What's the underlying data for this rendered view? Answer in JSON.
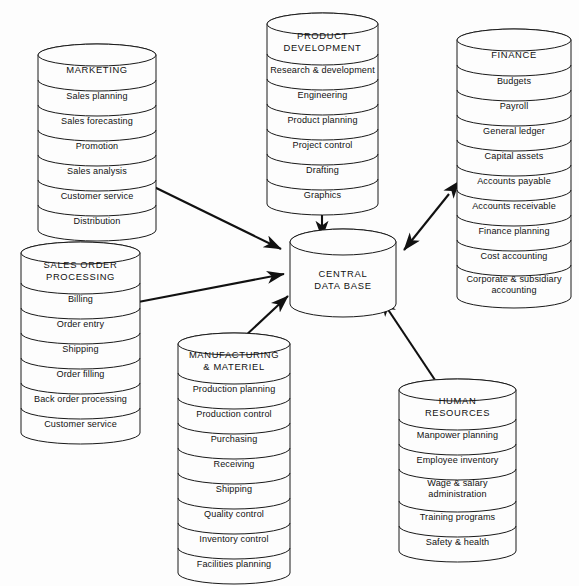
{
  "diagram": {
    "background_color": "#fdfdfd",
    "line_color": "#1a1a1a",
    "arrow_color": "#111111"
  },
  "center": {
    "name": "central-data-base",
    "label_lines": [
      "CENTRAL",
      "DATA BASE"
    ],
    "x": 290,
    "y": 242,
    "width": 106,
    "height": 62,
    "ry": 13
  },
  "cylinders": [
    {
      "id": "marketing",
      "title_lines": [
        "MARKETING"
      ],
      "items": [
        "Sales planning",
        "Sales forecasting",
        "Promotion",
        "Sales analysis",
        "Customer service",
        "Distribution"
      ],
      "x": 38,
      "y": 55,
      "width": 118,
      "band_h": 25,
      "title_h": 25,
      "ry": 11
    },
    {
      "id": "product-development",
      "title_lines": [
        "PRODUCT",
        "DEVELOPMENT"
      ],
      "items": [
        "Research & development",
        "Engineering",
        "Product planning",
        "Project control",
        "Drafting",
        "Graphics"
      ],
      "x": 267,
      "y": 24,
      "width": 111,
      "band_h": 25,
      "title_h": 30,
      "ry": 11
    },
    {
      "id": "finance",
      "title_lines": [
        "FINANCE"
      ],
      "items": [
        "Budgets",
        "Payroll",
        "General ledger",
        "Capital assets",
        "Accounts payable",
        "Accounts receivable",
        "Finance planning",
        "Cost accounting",
        "Corporate & subsidiary\naccounting"
      ],
      "x": 457,
      "y": 40,
      "width": 114,
      "band_h": 25,
      "title_h": 25,
      "ry": 11
    },
    {
      "id": "sales-order-processing",
      "title_lines": [
        "SALES  ORDER",
        "PROCESSING"
      ],
      "items": [
        "Billing",
        "Order entry",
        "Shipping",
        "Order filling",
        "Back order processing",
        "Customer service"
      ],
      "x": 21,
      "y": 253,
      "width": 119,
      "band_h": 25,
      "title_h": 30,
      "ry": 11
    },
    {
      "id": "manufacturing-materiel",
      "title_lines": [
        "MANUFACTURING",
        "& MATERIEL"
      ],
      "items": [
        "Production planning",
        "Production control",
        "Purchasing",
        "Receiving",
        "Shipping",
        "Quality control",
        "Inventory control",
        "Facilities planning"
      ],
      "x": 178,
      "y": 344,
      "width": 112,
      "band_h": 25,
      "title_h": 29,
      "ry": 11
    },
    {
      "id": "human-resources",
      "title_lines": [
        "HUMAN",
        "RESOURCES"
      ],
      "items": [
        "Manpower planning",
        "Employee inventory",
        "Wage & salary\nadministration",
        "Training programs",
        "Safety & health"
      ],
      "x": 399,
      "y": 390,
      "width": 117,
      "band_h": 25,
      "title_h": 29,
      "ry": 11
    }
  ],
  "connectors": [
    {
      "id": "marketing-to-db",
      "from": "marketing",
      "to": "central-data-base",
      "x1": 146,
      "y1": 183,
      "x2": 281,
      "y2": 249,
      "double": true
    },
    {
      "id": "product-development-to-db",
      "from": "product-development",
      "to": "central-data-base",
      "x1": 322,
      "y1": 210,
      "x2": 322,
      "y2": 238,
      "double": true
    },
    {
      "id": "finance-to-db",
      "from": "finance",
      "to": "central-data-base",
      "x1": 449,
      "y1": 194,
      "x2": 404,
      "y2": 250,
      "double": true
    },
    {
      "id": "sales-order-processing-to-db",
      "from": "sales-order-processing",
      "to": "central-data-base",
      "x1": 133,
      "y1": 303,
      "x2": 284,
      "y2": 274,
      "double": true
    },
    {
      "id": "manufacturing-to-db",
      "from": "manufacturing-materiel",
      "to": "central-data-base",
      "x1": 243,
      "y1": 338,
      "x2": 288,
      "y2": 296,
      "double": true
    },
    {
      "id": "human-resources-to-db",
      "from": "human-resources",
      "to": "central-data-base",
      "x1": 437,
      "y1": 383,
      "x2": 381,
      "y2": 299,
      "double": true
    }
  ]
}
